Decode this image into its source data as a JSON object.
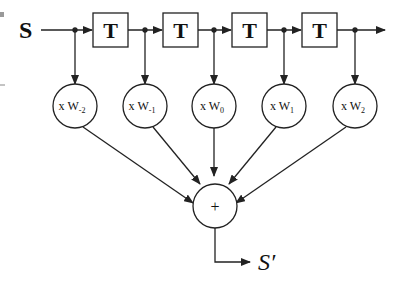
{
  "diagram": {
    "type": "fir-filter",
    "input_label": "S",
    "output_label": "S′",
    "delay_label": "T",
    "delays": 4,
    "sum_label": "+",
    "multipliers": [
      {
        "prefix": "x W",
        "sub": "-2"
      },
      {
        "prefix": "x W",
        "sub": "-1"
      },
      {
        "prefix": "x W",
        "sub": "0"
      },
      {
        "prefix": "x W",
        "sub": "1"
      },
      {
        "prefix": "x W",
        "sub": "2"
      }
    ],
    "colors": {
      "stroke": "#222222",
      "background": "#ffffff"
    }
  }
}
